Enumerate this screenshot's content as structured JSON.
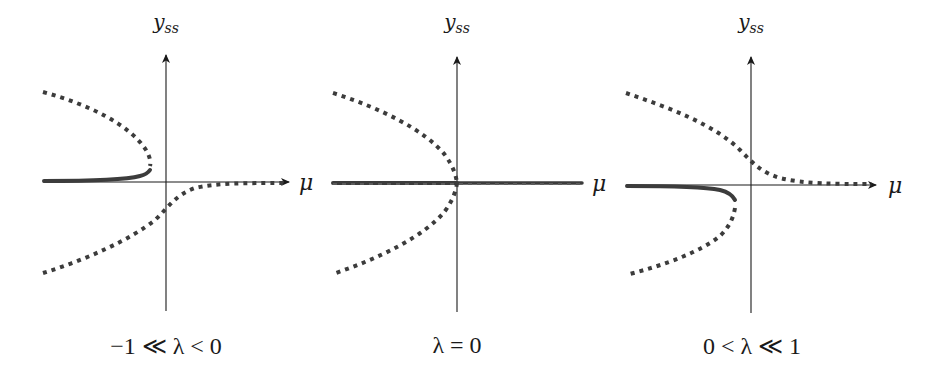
{
  "figure": {
    "panels": [
      {
        "id": "negative-lambda",
        "y_axis_label": "y",
        "y_axis_subscript": "ss",
        "x_axis_label": "μ",
        "caption": "−1 ≪ λ < 0"
      },
      {
        "id": "zero-lambda",
        "y_axis_label": "y",
        "y_axis_subscript": "ss",
        "x_axis_label": "μ",
        "caption": "λ = 0"
      },
      {
        "id": "positive-lambda",
        "y_axis_label": "y",
        "y_axis_subscript": "ss",
        "x_axis_label": "μ",
        "caption": "0 < λ ≪ 1"
      }
    ],
    "legend_semantics": {
      "solid": "stable steady state",
      "dotted": "unstable steady state"
    },
    "colors": {
      "axis": "#1a1a1a",
      "curve": "#3c3c3c",
      "background": "#ffffff"
    }
  }
}
